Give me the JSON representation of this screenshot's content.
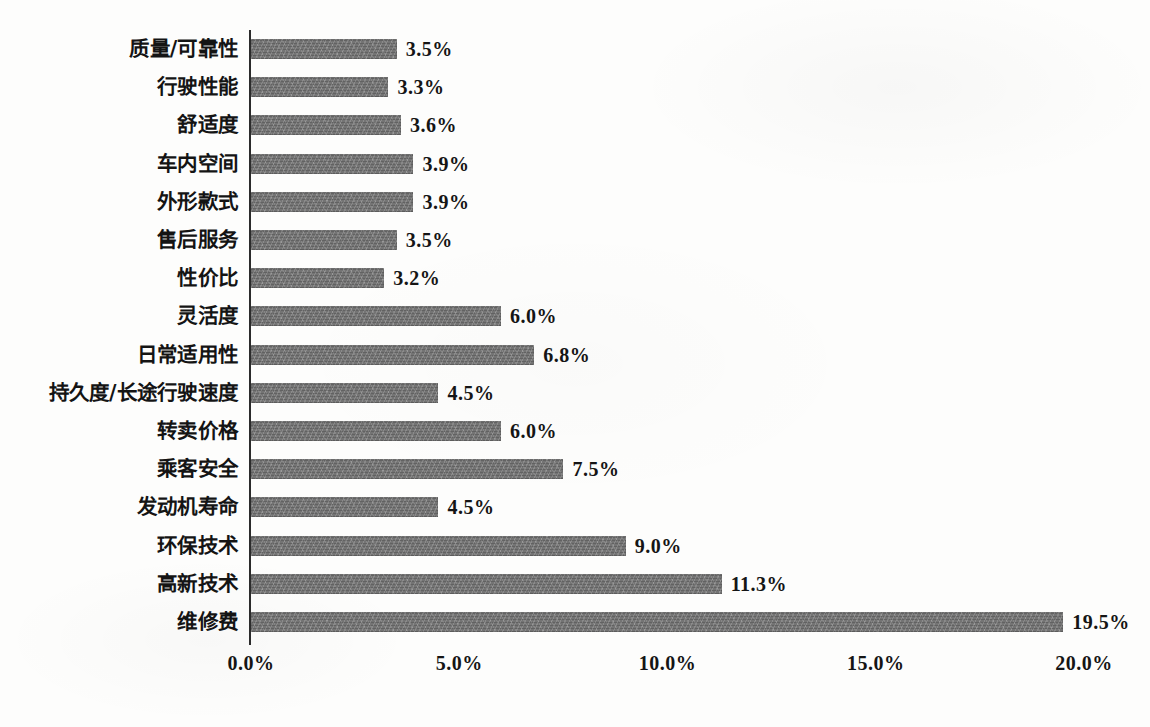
{
  "chart_data": {
    "type": "bar",
    "orientation": "horizontal",
    "title": "",
    "subtitle": "",
    "xlabel": "",
    "ylabel": "",
    "xlim": [
      0,
      20
    ],
    "grid": false,
    "legend": false,
    "bar_color": "#6d6d6d",
    "axis_color": "#2b2b2b",
    "value_suffix": "%",
    "x_ticks": [
      "0.0%",
      "5.0%",
      "10.0%",
      "15.0%",
      "20.0%"
    ],
    "x_tick_values": [
      0,
      5,
      10,
      15,
      20
    ],
    "categories": [
      "质量/可靠性",
      "行驶性能",
      "舒适度",
      "车内空间",
      "外形款式",
      "售后服务",
      "性价比",
      "灵活度",
      "日常适用性",
      "持久度/长途行驶速度",
      "转卖价格",
      "乘客安全",
      "发动机寿命",
      "环保技术",
      "高新技术",
      "维修费"
    ],
    "values": [
      3.5,
      3.3,
      3.6,
      3.9,
      3.9,
      3.5,
      3.2,
      6.0,
      6.8,
      4.5,
      6.0,
      7.5,
      4.5,
      9.0,
      11.3,
      19.5
    ],
    "value_labels": [
      "3.5%",
      "3.3%",
      "3.6%",
      "3.9%",
      "3.9%",
      "3.5%",
      "3.2%",
      "6.0%",
      "6.8%",
      "4.5%",
      "6.0%",
      "7.5%",
      "4.5%",
      "9.0%",
      "11.3%",
      "19.5%"
    ]
  }
}
